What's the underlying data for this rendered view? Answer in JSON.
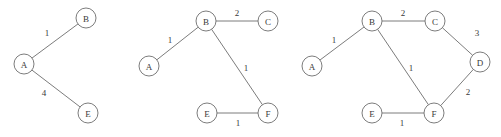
{
  "figure": {
    "background_color": "#ffffff",
    "stroke_color": "#6d6d6d",
    "text_color": "#3a3a3a",
    "node_radius": 10
  },
  "chart_data": {
    "type": "diagram",
    "subtype": "node-link-graph",
    "title": "",
    "panel_count": 3,
    "panels": [
      {
        "id": "graph-1",
        "label": "",
        "nodes": [
          {
            "id": "A",
            "label": "A",
            "x": 24,
            "y": 64
          },
          {
            "id": "B",
            "label": "B",
            "x": 86,
            "y": 18
          },
          {
            "id": "E",
            "label": "E",
            "x": 88,
            "y": 113
          }
        ],
        "edges": [
          {
            "source": "A",
            "target": "B",
            "weight": "1",
            "label_x": 47,
            "label_y": 33
          },
          {
            "source": "A",
            "target": "E",
            "weight": "4",
            "label_x": 44,
            "label_y": 93
          }
        ]
      },
      {
        "id": "graph-2",
        "label": "",
        "nodes": [
          {
            "id": "A",
            "label": "A",
            "x": 149,
            "y": 66
          },
          {
            "id": "B",
            "label": "B",
            "x": 206,
            "y": 21
          },
          {
            "id": "C",
            "label": "C",
            "x": 268,
            "y": 21
          },
          {
            "id": "E",
            "label": "E",
            "x": 207,
            "y": 113
          },
          {
            "id": "F",
            "label": "F",
            "x": 268,
            "y": 113
          }
        ],
        "edges": [
          {
            "source": "A",
            "target": "B",
            "weight": "1",
            "label_x": 170,
            "label_y": 40
          },
          {
            "source": "B",
            "target": "C",
            "weight": "2",
            "label_x": 237,
            "label_y": 13
          },
          {
            "source": "B",
            "target": "F",
            "weight": "1",
            "label_x": 246,
            "label_y": 68
          },
          {
            "source": "E",
            "target": "F",
            "weight": "1",
            "label_x": 238,
            "label_y": 123
          }
        ]
      },
      {
        "id": "graph-3",
        "label": "",
        "nodes": [
          {
            "id": "A",
            "label": "A",
            "x": 312,
            "y": 66
          },
          {
            "id": "B",
            "label": "B",
            "x": 372,
            "y": 21
          },
          {
            "id": "C",
            "label": "C",
            "x": 435,
            "y": 21
          },
          {
            "id": "D",
            "label": "D",
            "x": 480,
            "y": 62
          },
          {
            "id": "E",
            "label": "E",
            "x": 372,
            "y": 113
          },
          {
            "id": "F",
            "label": "F",
            "x": 434,
            "y": 113
          }
        ],
        "edges": [
          {
            "source": "A",
            "target": "B",
            "weight": "1",
            "label_x": 334,
            "label_y": 40
          },
          {
            "source": "B",
            "target": "C",
            "weight": "2",
            "label_x": 403,
            "label_y": 13
          },
          {
            "source": "C",
            "target": "D",
            "weight": "3",
            "label_x": 477,
            "label_y": 33
          },
          {
            "source": "D",
            "target": "F",
            "weight": "2",
            "label_x": 468,
            "label_y": 92
          },
          {
            "source": "B",
            "target": "F",
            "weight": "1",
            "label_x": 411,
            "label_y": 68
          },
          {
            "source": "E",
            "target": "F",
            "weight": "1",
            "label_x": 402,
            "label_y": 123
          }
        ]
      }
    ]
  }
}
